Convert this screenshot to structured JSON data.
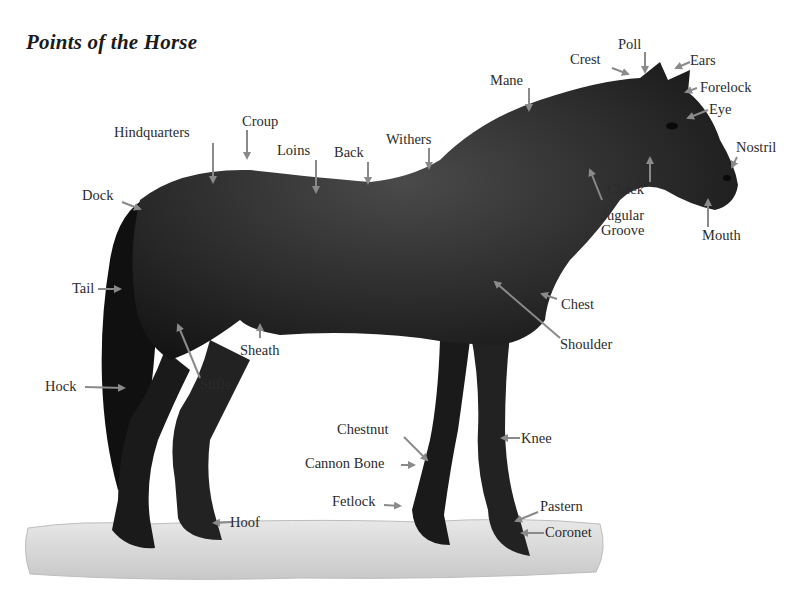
{
  "title": "Points of the Horse",
  "colors": {
    "arrow": "#8a8a8a",
    "horse_dark": "#1c1c1c",
    "horse_mid": "#3a3a3a",
    "ground": "#d4d4d4",
    "text": "#2b2b2b"
  },
  "labels": {
    "crest": "Crest",
    "poll": "Poll",
    "ears": "Ears",
    "mane": "Mane",
    "forelock": "Forelock",
    "eye": "Eye",
    "nostril": "Nostril",
    "hindquarters": "Hindquarters",
    "croup": "Croup",
    "loins": "Loins",
    "back": "Back",
    "withers": "Withers",
    "dock": "Dock",
    "cheek": "Cheek",
    "jugular_line1": "Jugular",
    "jugular_line2": "Groove",
    "mouth": "Mouth",
    "tail": "Tail",
    "chest": "Chest",
    "sheath": "Sheath",
    "shoulder": "Shoulder",
    "hock": "Hock",
    "stifle": "Stifle",
    "chestnut": "Chestnut",
    "knee": "Knee",
    "cannon_bone": "Cannon Bone",
    "fetlock": "Fetlock",
    "pastern": "Pastern",
    "hoof": "Hoof",
    "coronet": "Coronet"
  }
}
